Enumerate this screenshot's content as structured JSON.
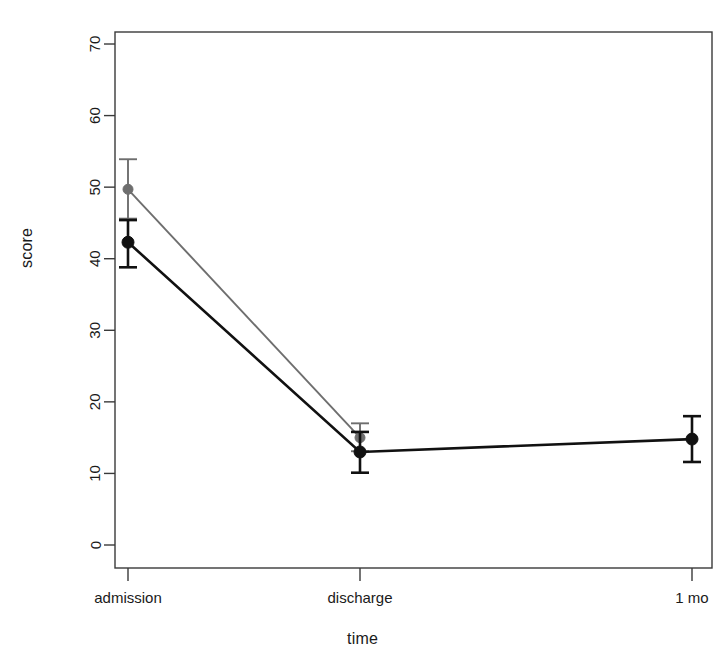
{
  "chart_data": {
    "type": "line",
    "title": "",
    "subtitle": "",
    "xlabel": "time",
    "ylabel": "score",
    "categories": [
      "admission",
      "discharge",
      "1 mo"
    ],
    "ylim": [
      0,
      73
    ],
    "yticks": [
      0,
      10,
      20,
      30,
      40,
      50,
      60,
      70
    ],
    "ytick_labels": [
      "0",
      "10",
      "20",
      "30",
      "40",
      "50",
      "60",
      "70"
    ],
    "grid": false,
    "legend": "none",
    "error_bars": "yes",
    "series": [
      {
        "name": "series-gray",
        "color": "#6e6e6e",
        "values": [
          49.7,
          15.0,
          null
        ],
        "err_low": [
          45.6,
          13.1,
          null
        ],
        "err_high": [
          53.9,
          17.0,
          null
        ]
      },
      {
        "name": "series-black",
        "color": "#111111",
        "values": [
          42.3,
          13.0,
          14.8
        ],
        "err_low": [
          38.8,
          10.1,
          11.6
        ],
        "err_high": [
          45.4,
          15.8,
          18.0
        ]
      }
    ],
    "annotations": []
  },
  "axis": {
    "y_title": "score",
    "x_title": "time"
  }
}
